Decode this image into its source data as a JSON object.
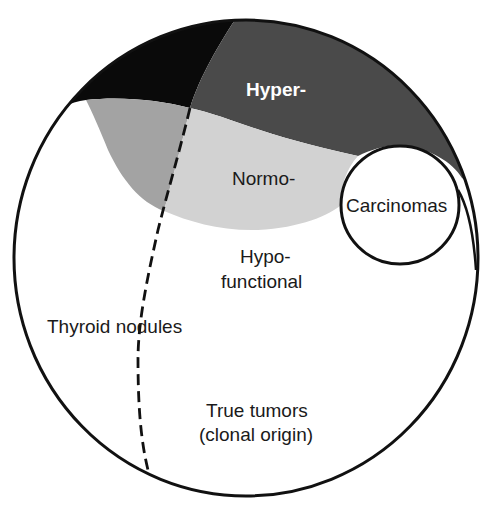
{
  "diagram": {
    "labels": {
      "hyper": "Hyper-",
      "normo": "Normo-",
      "carcinomas": "Carcinomas",
      "hypo_line1": "Hypo-",
      "hypo_line2": "functional",
      "thyroid_nodules": "Thyroid nodules",
      "true_tumors_line1": "True tumors",
      "true_tumors_line2": "(clonal origin)"
    },
    "regions": [
      {
        "name": "hyperfunctional-non-tumor",
        "color": "#0a0a0a"
      },
      {
        "name": "hyperfunctional-tumor",
        "color": "#4a4a4a"
      },
      {
        "name": "normofunctional-non-tumor",
        "color": "#a3a3a3"
      },
      {
        "name": "normofunctional-tumor",
        "color": "#d2d2d2"
      },
      {
        "name": "hypofunctional",
        "color": "#ffffff"
      },
      {
        "name": "carcinomas",
        "color": "#ffffff"
      }
    ],
    "colors": {
      "outline": "#111111",
      "hyper_text": "#ffffff",
      "text": "#1a1a1a"
    }
  }
}
